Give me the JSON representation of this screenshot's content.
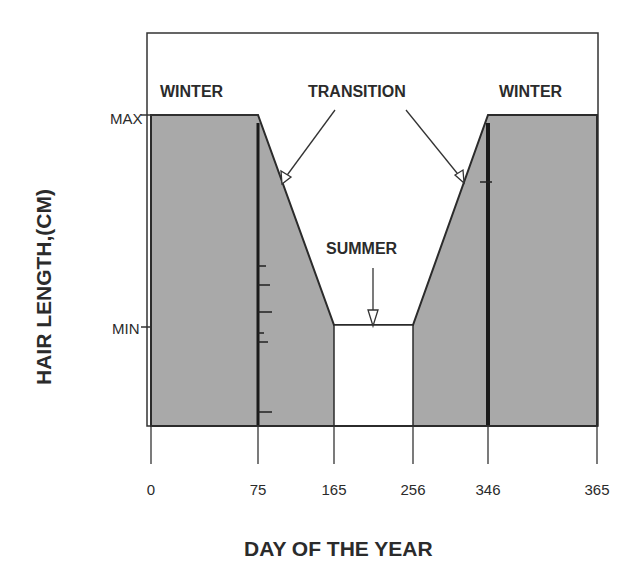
{
  "chart_data": {
    "type": "area",
    "title": "",
    "xlabel": "DAY OF THE YEAR",
    "ylabel": "HAIR LENGTH,(CM)",
    "x_ticks": [
      0,
      75,
      165,
      256,
      346,
      365
    ],
    "x_tick_labels": [
      "0",
      "75",
      "165",
      "256",
      "346",
      "365"
    ],
    "y_ticks": [
      "MAX",
      "MIN"
    ],
    "xlim": [
      0,
      365
    ],
    "ylim_labels": [
      "MIN",
      "MAX"
    ],
    "series": [
      {
        "name": "Hair length",
        "points": [
          {
            "x": 0,
            "y": "MAX"
          },
          {
            "x": 75,
            "y": "MAX"
          },
          {
            "x": 165,
            "y": "MIN"
          },
          {
            "x": 256,
            "y": "MIN"
          },
          {
            "x": 346,
            "y": "MAX"
          },
          {
            "x": 365,
            "y": "MAX"
          }
        ]
      }
    ],
    "regions": [
      {
        "label": "WINTER",
        "from": 0,
        "to": 75
      },
      {
        "label": "TRANSITION",
        "from": 75,
        "to": 165
      },
      {
        "label": "SUMMER",
        "from": 165,
        "to": 256
      },
      {
        "label": "TRANSITION",
        "from": 256,
        "to": 346
      },
      {
        "label": "WINTER",
        "from": 346,
        "to": 365
      }
    ],
    "annotations": [
      {
        "text": "WINTER",
        "target": "left winter plateau"
      },
      {
        "text": "TRANSITION",
        "target": "both sloped transitions (two arrows)"
      },
      {
        "text": "SUMMER",
        "target": "summer minimum (arrow)"
      },
      {
        "text": "WINTER",
        "target": "right winter plateau"
      }
    ],
    "fill_color": "#a9a9a9",
    "line_color": "#2b2b2b",
    "grid": false
  },
  "labels": {
    "winter_left": "WINTER",
    "transition": "TRANSITION",
    "winter_right": "WINTER",
    "summer": "SUMMER",
    "y_max": "MAX",
    "y_min": "MIN",
    "ylabel": "HAIR LENGTH,(CM)",
    "xlabel": "DAY OF THE YEAR"
  }
}
